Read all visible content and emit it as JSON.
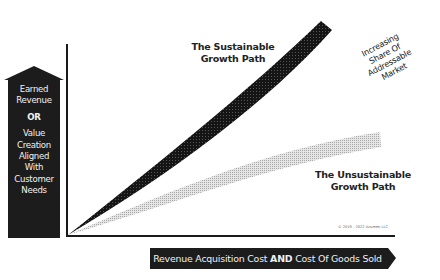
{
  "diagram": {
    "y_axis_arrow": {
      "line1": "Earned",
      "line2": "Revenue",
      "or": "OR",
      "line3": "Value",
      "line4": "Creation",
      "line5": "Aligned",
      "line6": "With",
      "line7": "Customer",
      "line8": "Needs"
    },
    "x_axis_arrow": {
      "part1": "Revenue Acquisition Cost ",
      "bold": "AND",
      "part2": " Cost Of Goods Sold"
    },
    "sustainable_path": {
      "line1": "The Sustainable",
      "line2": "Growth Path",
      "color": "#1a1a1a"
    },
    "unsustainable_path": {
      "line1": "The Unsustainable",
      "line2": "Growth Path",
      "color": "#c8c8c8"
    },
    "market_annotation": {
      "line1": "Increasing",
      "line2": "Share Of",
      "line3": "Addressable",
      "line4": "Market"
    },
    "copyright": "© 2019 - 2022 Acumen LLC"
  }
}
